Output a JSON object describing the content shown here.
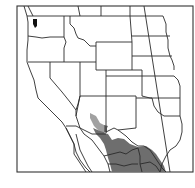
{
  "map": {
    "type": "species range map",
    "region": "Western United States and northern Mexico",
    "colors": {
      "background": "#ffffff",
      "frame": "#333333",
      "borders": "#2a2a2a",
      "range_fill": "#6e6e6e"
    },
    "layers": [
      {
        "name": "state-borders",
        "label": "State boundaries"
      },
      {
        "name": "range",
        "label": "Shaded distribution range"
      }
    ]
  }
}
